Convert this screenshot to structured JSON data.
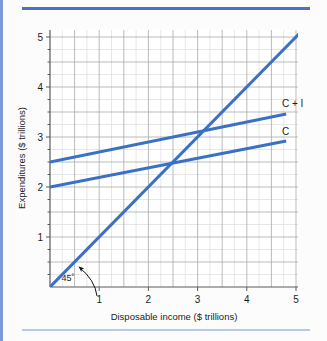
{
  "figure": {
    "background_color": "#fcfcfc",
    "rail_color": "#7b9ad6",
    "top_rule_color": "#4a73c4",
    "bottom_rule_color": "#b9cbe4"
  },
  "chart_data": {
    "type": "line",
    "title": "",
    "xlabel": "Disposable income ($ trillions)",
    "ylabel": "Expenditures ($ trillions)",
    "xlim": [
      0,
      5.2
    ],
    "ylim": [
      0,
      5.4
    ],
    "xticks": [
      "1",
      "2",
      "3",
      "4",
      "5"
    ],
    "xtick_values": [
      1,
      2,
      3,
      4,
      5
    ],
    "yticks": [
      "1",
      "2",
      "3",
      "4",
      "5"
    ],
    "ytick_values": [
      1,
      2,
      3,
      4,
      5
    ],
    "grid": true,
    "grid_minor_spacing": 0.25,
    "grid_major_spacing": 0.5,
    "grid_color": "#d8d8d8",
    "grid_major_color": "#a8a8a8",
    "legend": "inline-right-labels",
    "line_color": "#3b71c4",
    "series": [
      {
        "name": "45° line",
        "label": "",
        "intercept": 0,
        "slope": 1,
        "x": [
          0,
          5.2
        ],
        "values": [
          0,
          5.2
        ]
      },
      {
        "name": "C + I",
        "label": "C + I",
        "intercept": 2.5,
        "slope": 0.2,
        "x": [
          0,
          4.8
        ],
        "values": [
          2.5,
          3.46
        ]
      },
      {
        "name": "C",
        "label": "C",
        "intercept": 2.0,
        "slope": 0.192,
        "x": [
          0,
          4.8
        ],
        "values": [
          2.0,
          2.92
        ]
      }
    ],
    "annotations": [
      {
        "name": "angle-45",
        "text": "45˚",
        "x": 0.85,
        "y": 0.33,
        "points_to": {
          "x": 1.22,
          "y": 1.22
        }
      }
    ],
    "intersections": [
      {
        "of": [
          "45° line",
          "C"
        ],
        "x": 2.48,
        "y": 2.48
      },
      {
        "of": [
          "45° line",
          "C + I"
        ],
        "x": 3.12,
        "y": 3.12
      }
    ]
  }
}
